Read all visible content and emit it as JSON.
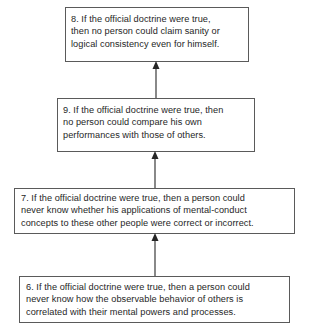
{
  "diagram": {
    "type": "argument-chain",
    "direction": "bottom-to-top",
    "nodes": [
      {
        "id": "8",
        "lines": [
          "8. If the official doctrine were true,",
          "then no person could claim sanity or",
          "logical consistency even for himself."
        ]
      },
      {
        "id": "9",
        "lines": [
          "9. If the official doctrine were true, then",
          "no person could compare his own",
          "performances with those of others."
        ]
      },
      {
        "id": "7",
        "lines": [
          "7. If the official doctrine were true, then a person could",
          "never know whether his applications of mental-conduct",
          "concepts to these other people were correct or incorrect."
        ]
      },
      {
        "id": "6",
        "lines": [
          "6. If the official doctrine were true, then a person could",
          "never know how the observable behavior of others is",
          "correlated with their mental powers and processes."
        ]
      }
    ],
    "edges": [
      {
        "from": "6",
        "to": "7"
      },
      {
        "from": "7",
        "to": "9"
      },
      {
        "from": "9",
        "to": "8"
      }
    ],
    "colors": {
      "border": "#5a5a5a",
      "text": "#262626",
      "arrow": "#3a3a3a"
    }
  }
}
